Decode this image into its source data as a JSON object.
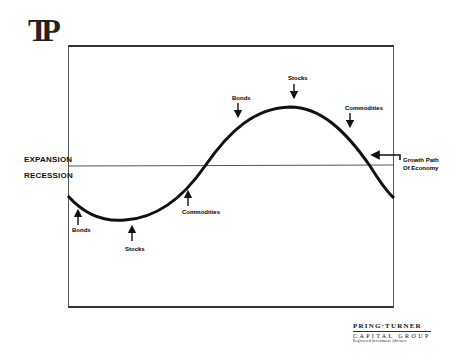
{
  "logo": {
    "text": "TP"
  },
  "labels": {
    "expansion": "EXPANSION",
    "recession": "RECESSION",
    "growth_path_line1": "Growth Path",
    "growth_path_line2": "Of Economy"
  },
  "annotations": {
    "bottom": [
      {
        "label": "Bonds",
        "direction": "up"
      },
      {
        "label": "Stocks",
        "direction": "up"
      },
      {
        "label": "Commodities",
        "direction": "up"
      }
    ],
    "top": [
      {
        "label": "Bonds",
        "direction": "down"
      },
      {
        "label": "Stocks",
        "direction": "down"
      },
      {
        "label": "Commodities",
        "direction": "down"
      }
    ]
  },
  "brand": {
    "name": "PRING·TURNER",
    "line2": "CAPITAL GROUP",
    "line3": "Registered Investment Advisors"
  },
  "colors": {
    "curve": "#111111",
    "frame": "#444444",
    "background": "#ffffff"
  }
}
